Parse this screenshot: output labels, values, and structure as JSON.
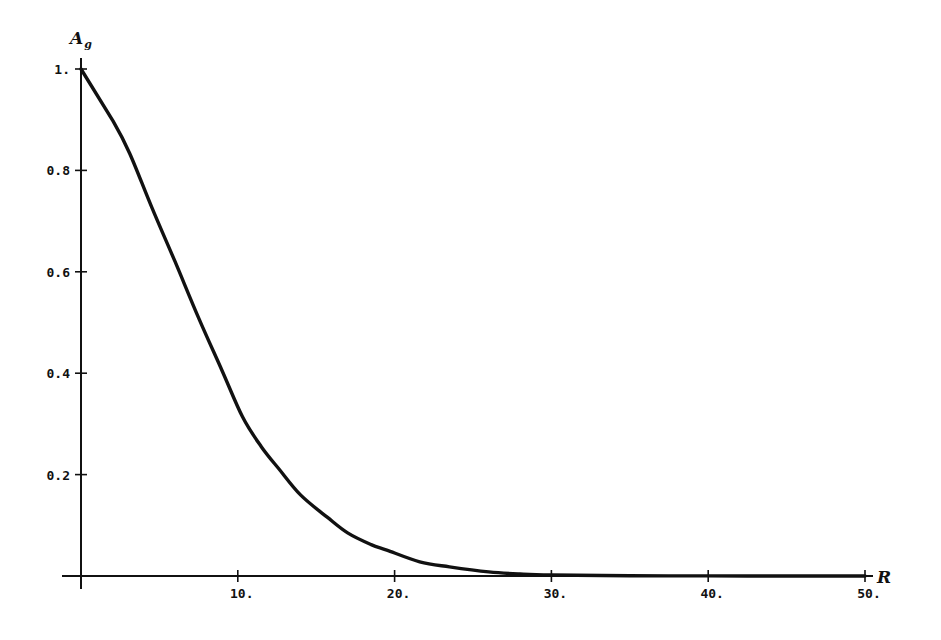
{
  "chart_data": {
    "type": "line",
    "title": "",
    "xlabel": "R",
    "ylabel": "A",
    "ylabel_subscript": "g",
    "xlim": [
      0,
      50
    ],
    "ylim": [
      0,
      1
    ],
    "grid": false,
    "legend": null,
    "x_ticks": [
      10,
      20,
      30,
      40,
      50
    ],
    "x_tick_labels": [
      "10.",
      "20.",
      "30.",
      "40.",
      "50."
    ],
    "y_ticks": [
      0.2,
      0.4,
      0.6,
      0.8,
      1.0
    ],
    "y_tick_labels": [
      "0.2",
      "0.4",
      "0.6",
      "0.8",
      "1."
    ],
    "series": [
      {
        "name": "A_g",
        "color": "#111111",
        "x": [
          0,
          2.05,
          3.1,
          4.5,
          6.0,
          7.5,
          9.0,
          10.3,
          11.5,
          12.6,
          14.0,
          15.7,
          17.0,
          18.5,
          19.5,
          21.6,
          23.5,
          26.0,
          28.0,
          30.0,
          35.0,
          40.0,
          45.0,
          50.0
        ],
        "values": [
          1.0,
          0.897,
          0.834,
          0.728,
          0.62,
          0.509,
          0.405,
          0.314,
          0.255,
          0.212,
          0.16,
          0.116,
          0.085,
          0.062,
          0.051,
          0.028,
          0.018,
          0.008,
          0.004,
          0.002,
          0.0005,
          0.0001,
          0.0,
          0.0
        ]
      }
    ]
  },
  "axes": {
    "x_label": "R",
    "y_label_main": "A",
    "y_label_sub": "g"
  }
}
